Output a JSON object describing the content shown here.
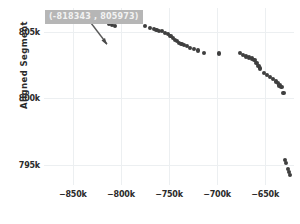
{
  "chart_data": {
    "type": "scatter",
    "title": "",
    "xlabel": "",
    "ylabel": "Aligned Segment",
    "xlim": [
      -880000,
      -620000
    ],
    "ylim": [
      793500,
      806800
    ],
    "grid": true,
    "legend": null,
    "marker_color": "#3f3f3f",
    "grid_color": "#eceff1",
    "xticks": [
      -850000,
      -800000,
      -750000,
      -700000,
      -650000
    ],
    "xticklabels": [
      "−850k",
      "−800k",
      "−750k",
      "−700k",
      "−650k"
    ],
    "yticks": [
      805000,
      800000,
      795000
    ],
    "yticklabels": [
      "805k",
      "800k",
      "795k"
    ],
    "annotation": {
      "text": "(-818343 , 805973)",
      "x": -818343,
      "y": 805973,
      "background": "#b6b6b6",
      "text_color": "#f2f2f2",
      "arrow": true
    },
    "points": [
      {
        "x": -820000,
        "y": 806100
      },
      {
        "x": -818343,
        "y": 805973
      },
      {
        "x": -816500,
        "y": 805880
      },
      {
        "x": -814500,
        "y": 805760
      },
      {
        "x": -812000,
        "y": 805640
      },
      {
        "x": -809000,
        "y": 805520
      },
      {
        "x": -806000,
        "y": 805460
      },
      {
        "x": -775000,
        "y": 805420
      },
      {
        "x": -770000,
        "y": 805300
      },
      {
        "x": -766000,
        "y": 805210
      },
      {
        "x": -763000,
        "y": 805130
      },
      {
        "x": -760000,
        "y": 805090
      },
      {
        "x": -757000,
        "y": 805060
      },
      {
        "x": -754000,
        "y": 804950
      },
      {
        "x": -751000,
        "y": 804830
      },
      {
        "x": -748500,
        "y": 804700
      },
      {
        "x": -746000,
        "y": 804560
      },
      {
        "x": -744000,
        "y": 804420
      },
      {
        "x": -742000,
        "y": 804290
      },
      {
        "x": -740000,
        "y": 804200
      },
      {
        "x": -737000,
        "y": 804120
      },
      {
        "x": -734000,
        "y": 804020
      },
      {
        "x": -731000,
        "y": 803930
      },
      {
        "x": -728000,
        "y": 803790
      },
      {
        "x": -724000,
        "y": 803700
      },
      {
        "x": -720000,
        "y": 803600
      },
      {
        "x": -714000,
        "y": 803400
      },
      {
        "x": -698000,
        "y": 803380
      },
      {
        "x": -676000,
        "y": 803400
      },
      {
        "x": -673000,
        "y": 803280
      },
      {
        "x": -670000,
        "y": 803160
      },
      {
        "x": -667000,
        "y": 803080
      },
      {
        "x": -664000,
        "y": 803000
      },
      {
        "x": -661000,
        "y": 802900
      },
      {
        "x": -659000,
        "y": 802640
      },
      {
        "x": -657000,
        "y": 802430
      },
      {
        "x": -655000,
        "y": 802250
      },
      {
        "x": -651000,
        "y": 801900
      },
      {
        "x": -648000,
        "y": 801740
      },
      {
        "x": -645000,
        "y": 801600
      },
      {
        "x": -642000,
        "y": 801480
      },
      {
        "x": -639000,
        "y": 801280
      },
      {
        "x": -637000,
        "y": 801150
      },
      {
        "x": -635000,
        "y": 800980
      },
      {
        "x": -633000,
        "y": 800850
      },
      {
        "x": -631000,
        "y": 800400
      },
      {
        "x": -629000,
        "y": 795400
      },
      {
        "x": -628000,
        "y": 795150
      },
      {
        "x": -626500,
        "y": 794700
      },
      {
        "x": -625500,
        "y": 794500
      },
      {
        "x": -624500,
        "y": 794250
      }
    ]
  }
}
